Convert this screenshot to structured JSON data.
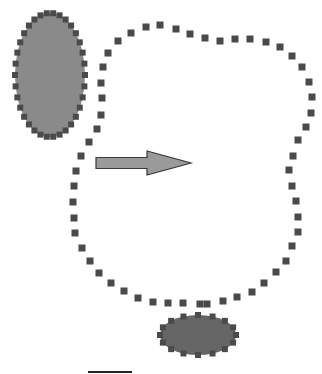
{
  "diagram": {
    "colors": {
      "ellipse_top_fill": "#8a8a8a",
      "ellipse_bottom_fill": "#666666",
      "dot": "#4a4a4a",
      "arrow_fill": "#9a9a9a",
      "arrow_stroke": "#3a3a3a",
      "background": "#ffffff"
    },
    "ellipse_top": {
      "cx": 50,
      "cy": 75,
      "rx": 35,
      "ry": 62
    },
    "ellipse_bottom": {
      "cx": 198,
      "cy": 335,
      "rx": 38,
      "ry": 20
    },
    "arrow": {
      "x1": 96,
      "y1": 163,
      "x2": 191,
      "y2": 163,
      "shaft_half": 5.5,
      "head_half": 12,
      "head_base_x": 147
    },
    "region_path": [
      [
        118,
        41
      ],
      [
        131,
        33
      ],
      [
        146,
        27
      ],
      [
        160,
        25
      ],
      [
        176,
        29
      ],
      [
        190,
        34
      ],
      [
        205,
        38
      ],
      [
        220,
        41
      ],
      [
        235,
        39
      ],
      [
        250,
        39
      ],
      [
        266,
        42
      ],
      [
        280,
        47
      ],
      [
        292,
        56
      ],
      [
        302,
        67
      ],
      [
        309,
        82
      ],
      [
        312,
        97
      ],
      [
        311,
        113
      ],
      [
        306,
        127
      ],
      [
        298,
        140
      ],
      [
        293,
        156
      ],
      [
        289,
        170
      ],
      [
        292,
        186
      ],
      [
        296,
        201
      ],
      [
        298,
        217
      ],
      [
        298,
        232
      ],
      [
        292,
        246
      ],
      [
        286,
        261
      ],
      [
        276,
        272
      ],
      [
        264,
        283
      ],
      [
        252,
        292
      ],
      [
        237,
        297
      ],
      [
        223,
        301
      ],
      [
        207,
        304
      ],
      [
        200,
        304
      ],
      [
        183,
        303
      ],
      [
        168,
        303
      ],
      [
        153,
        302
      ],
      [
        138,
        298
      ],
      [
        124,
        291
      ],
      [
        111,
        283
      ],
      [
        99,
        273
      ],
      [
        90,
        261
      ],
      [
        82,
        248
      ],
      [
        75,
        233
      ],
      [
        74,
        218
      ],
      [
        73,
        202
      ],
      [
        74,
        186
      ],
      [
        76,
        171
      ],
      [
        81,
        156
      ],
      [
        89,
        142
      ],
      [
        97,
        129
      ],
      [
        101,
        115
      ],
      [
        102,
        98
      ],
      [
        101,
        83
      ],
      [
        103,
        67
      ],
      [
        108,
        53
      ]
    ],
    "bottom_line": {
      "x1": 88,
      "x2": 132,
      "y": 372
    }
  }
}
